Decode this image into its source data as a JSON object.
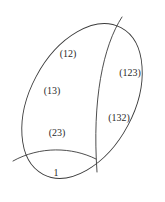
{
  "figure": {
    "canvas": {
      "width": 165,
      "height": 202,
      "background": "#ffffff"
    },
    "stroke_color": "#3a3a3a",
    "stroke_width": 0.9,
    "label_color": "#2b2b2b",
    "label_font_size": 10,
    "outline": {
      "name": "outer-ellipse",
      "center_x": 82,
      "center_y": 101,
      "radius_x": 83,
      "radius_y": 52,
      "rotation_deg": -62
    },
    "vertices": [
      {
        "name": "top-junction",
        "x": 122,
        "y": 17
      },
      {
        "name": "left-junction",
        "x": 13,
        "y": 161
      },
      {
        "name": "bottom-junction",
        "x": 97,
        "y": 172
      }
    ],
    "dividers": [
      {
        "name": "main-vertical-arc",
        "from": "top-junction",
        "to": "bottom-junction",
        "path": "M 122 17 C 103 46, 92 100, 97 172"
      },
      {
        "name": "lower-horizontal-arc",
        "from": "left-junction",
        "to": "bottom-junction",
        "path": "M 13 161 C 40 146, 72 147, 96 159"
      }
    ],
    "regions": [
      {
        "id": "r-12",
        "name": "region-12",
        "label": "(12)",
        "x": 68,
        "y": 53
      },
      {
        "id": "r-13",
        "name": "region-13",
        "label": "(13)",
        "x": 52,
        "y": 90
      },
      {
        "id": "r-23",
        "name": "region-23",
        "label": "(23)",
        "x": 57,
        "y": 132
      },
      {
        "id": "r-1",
        "name": "region-identity",
        "label": "1",
        "x": 56,
        "y": 172
      },
      {
        "id": "r-123",
        "name": "region-123",
        "label": "(123)",
        "x": 130,
        "y": 72
      },
      {
        "id": "r-132",
        "name": "region-132",
        "label": "(132)",
        "x": 119,
        "y": 117
      }
    ]
  }
}
